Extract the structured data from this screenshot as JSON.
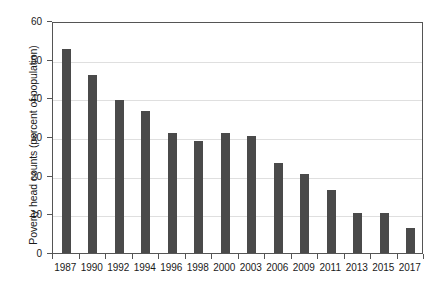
{
  "chart_data": {
    "type": "bar",
    "title": "",
    "xlabel": "",
    "ylabel": "Poverty head counts (percent of population)",
    "categories": [
      "1987",
      "1990",
      "1992",
      "1994",
      "1996",
      "1998",
      "2000",
      "2003",
      "2006",
      "2009",
      "2011",
      "2013",
      "2015",
      "2017"
    ],
    "values": [
      52.8,
      46.1,
      39.7,
      36.8,
      31.0,
      29.0,
      31.0,
      30.3,
      23.4,
      20.5,
      16.4,
      10.3,
      10.3,
      6.5
    ],
    "series": [
      {
        "name": "Poverty head counts",
        "values": [
          52.8,
          46.1,
          39.7,
          36.8,
          31.0,
          29.0,
          31.0,
          30.3,
          23.4,
          20.5,
          16.4,
          10.3,
          10.3,
          6.5
        ]
      }
    ],
    "ylim": [
      0,
      60
    ],
    "yticks": [
      0,
      10,
      20,
      30,
      40,
      50,
      60
    ],
    "ytick_labels": [
      "0",
      "10",
      "20",
      "30",
      "40",
      "50",
      "60"
    ],
    "grid": "horizontal",
    "legend": "none",
    "bar_color": "#4a4a4a",
    "gridline_color": "#dfdfdf",
    "axis_color": "#555555",
    "background_color": "#ffffff"
  }
}
